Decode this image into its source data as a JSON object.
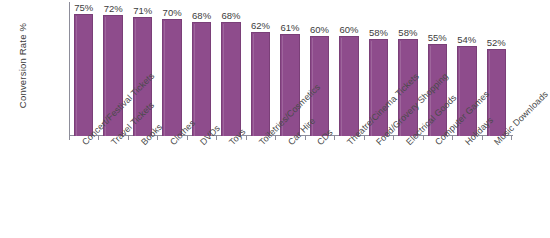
{
  "chart_data": {
    "type": "bar",
    "title": "",
    "subtitle": "",
    "xlabel": "",
    "ylabel": "Conversion Rate %",
    "ylim": [
      0,
      80
    ],
    "grid": false,
    "legend": "none",
    "orientation": "vertical",
    "bar_color": "#8E4C8C",
    "bar_border_color": "#7A3F78",
    "background_color": "#FFFFFF",
    "axis_color": "#8D8D9A",
    "label_color": "#3C3C3C",
    "value_label_suffix": "%",
    "x_tick_label_rotation": -45,
    "categories": [
      "Concert/Festival Tickets",
      "Travel Tickets",
      "Books",
      "Clothes",
      "DVDs",
      "Toys",
      "Toiletries/Cosmetics",
      "Car Hire",
      "CDs",
      "Theatre/Cinema Tickets",
      "Food/Grovery Shopping",
      "Electrical Goods",
      "Computer Games",
      "Holidays",
      "Music Downloads"
    ],
    "values": [
      75,
      72,
      71,
      70,
      68,
      68,
      62,
      61,
      60,
      60,
      58,
      58,
      55,
      54,
      52
    ],
    "value_labels": [
      "75%",
      "72%",
      "71%",
      "70%",
      "68%",
      "68%",
      "62%",
      "61%",
      "60%",
      "60%",
      "58%",
      "58%",
      "55%",
      "54%",
      "52%"
    ]
  }
}
